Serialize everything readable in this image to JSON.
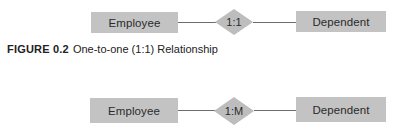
{
  "diagrams": [
    {
      "entity_left": "Employee",
      "relationship": "1:1",
      "entity_right": "Dependent"
    },
    {
      "entity_left": "Employee",
      "relationship": "1:M",
      "entity_right": "Dependent"
    }
  ],
  "caption": {
    "figure_number": "FIGURE 0.2",
    "text": "One-to-one (1:1) Relationship"
  },
  "colors": {
    "entity_fill": "#c3c3c3",
    "relationship_fill": "#bdbdbd",
    "connector": "#6d6d6d",
    "text": "#222222"
  }
}
